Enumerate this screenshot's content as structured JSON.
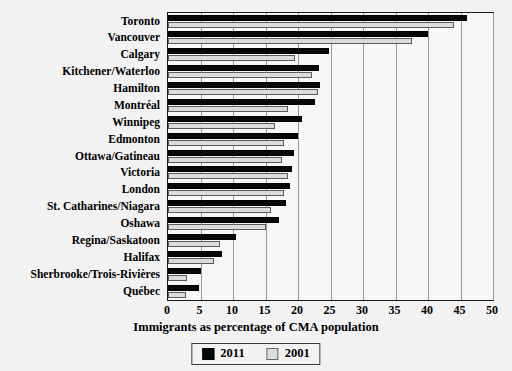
{
  "chart_data": {
    "type": "bar",
    "orientation": "horizontal",
    "title": "",
    "xlabel": "Immigrants as percentage of CMA population",
    "ylabel": "",
    "xlim": [
      0,
      50
    ],
    "xticks": [
      0,
      5,
      10,
      15,
      20,
      25,
      30,
      35,
      40,
      45,
      50
    ],
    "xtick_labels": [
      "0",
      "5",
      "10",
      "15",
      "20",
      "25",
      "30",
      "35",
      "40",
      "45",
      "50"
    ],
    "grid": true,
    "legend_position": "bottom-center",
    "categories": [
      "Toronto",
      "Vancouver",
      "Calgary",
      "Kitchener/Waterloo",
      "Hamilton",
      "Montréal",
      "Winnipeg",
      "Edmonton",
      "Ottawa/Gatineau",
      "Victoria",
      "London",
      "St. Catharines/Niagara",
      "Oshawa",
      "Regina/Saskatoon",
      "Halifax",
      "Sherbrooke/Trois-Rivières",
      "Québec"
    ],
    "series": [
      {
        "name": "2011",
        "color": "#080808",
        "values": [
          46.0,
          40.0,
          24.7,
          23.2,
          23.4,
          22.6,
          20.6,
          20.0,
          19.4,
          19.0,
          18.8,
          18.1,
          17.0,
          10.5,
          8.3,
          5.0,
          4.8
        ]
      },
      {
        "name": "2001",
        "color": "#dcdcdc",
        "values": [
          44.0,
          37.5,
          19.6,
          22.1,
          23.1,
          18.4,
          16.5,
          17.8,
          17.6,
          18.4,
          17.9,
          15.9,
          15.0,
          8.0,
          7.1,
          2.9,
          2.7
        ]
      }
    ]
  },
  "legend": {
    "entries": [
      {
        "label": "2011",
        "swatch": "black-filled-square"
      },
      {
        "label": "2001",
        "swatch": "light-gray-square"
      }
    ]
  }
}
